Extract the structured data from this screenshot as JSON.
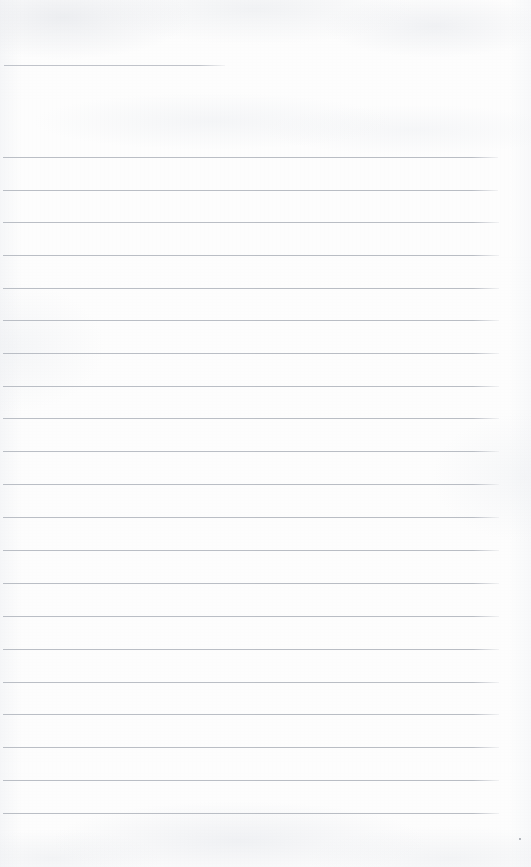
{
  "page": {
    "kind": "scanned-lined-notebook-page",
    "width": 531,
    "height": 867,
    "paper_color": "#fdfdfd",
    "rule_color": "#b6bac2",
    "text_content": ""
  },
  "rules": [
    {
      "name": "rule-partial-top",
      "y": 65,
      "x": 4,
      "width": 221,
      "partial": true
    },
    {
      "name": "rule-1",
      "y": 157,
      "x": 3,
      "width": 495,
      "partial": false
    },
    {
      "name": "rule-2",
      "y": 190,
      "x": 3,
      "width": 495,
      "partial": false
    },
    {
      "name": "rule-3",
      "y": 222,
      "x": 3,
      "width": 496,
      "partial": false
    },
    {
      "name": "rule-4",
      "y": 255,
      "x": 3,
      "width": 496,
      "partial": false
    },
    {
      "name": "rule-5",
      "y": 288,
      "x": 3,
      "width": 496,
      "partial": false
    },
    {
      "name": "rule-6",
      "y": 320,
      "x": 3,
      "width": 496,
      "partial": false
    },
    {
      "name": "rule-7",
      "y": 353,
      "x": 3,
      "width": 496,
      "partial": false
    },
    {
      "name": "rule-8",
      "y": 386,
      "x": 3,
      "width": 496,
      "partial": false
    },
    {
      "name": "rule-9",
      "y": 418,
      "x": 3,
      "width": 496,
      "partial": false
    },
    {
      "name": "rule-10",
      "y": 451,
      "x": 3,
      "width": 496,
      "partial": false
    },
    {
      "name": "rule-11",
      "y": 484,
      "x": 3,
      "width": 496,
      "partial": false
    },
    {
      "name": "rule-12",
      "y": 517,
      "x": 3,
      "width": 496,
      "partial": false
    },
    {
      "name": "rule-13",
      "y": 550,
      "x": 3,
      "width": 496,
      "partial": false
    },
    {
      "name": "rule-14",
      "y": 583,
      "x": 3,
      "width": 496,
      "partial": false
    },
    {
      "name": "rule-15",
      "y": 616,
      "x": 3,
      "width": 496,
      "partial": false
    },
    {
      "name": "rule-16",
      "y": 649,
      "x": 3,
      "width": 496,
      "partial": false
    },
    {
      "name": "rule-17",
      "y": 682,
      "x": 3,
      "width": 496,
      "partial": false
    },
    {
      "name": "rule-18",
      "y": 714,
      "x": 3,
      "width": 496,
      "partial": false
    },
    {
      "name": "rule-19",
      "y": 747,
      "x": 3,
      "width": 496,
      "partial": false
    },
    {
      "name": "rule-20",
      "y": 780,
      "x": 3,
      "width": 496,
      "partial": false
    },
    {
      "name": "rule-21",
      "y": 813,
      "x": 3,
      "width": 496,
      "partial": false
    }
  ],
  "specks": [
    {
      "name": "speck-bottom-right",
      "x": 519,
      "y": 838
    }
  ]
}
